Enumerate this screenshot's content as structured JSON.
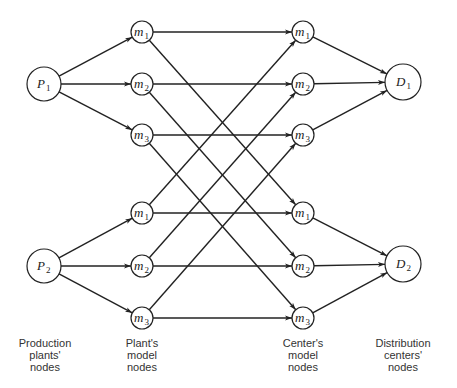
{
  "diagram": {
    "type": "network flow diagram",
    "nodes": {
      "production": [
        {
          "id": "P1",
          "label": "P",
          "sub": "1",
          "x": 44,
          "y": 84,
          "r": 17
        },
        {
          "id": "P2",
          "label": "P",
          "sub": "2",
          "x": 44,
          "y": 266,
          "r": 17
        }
      ],
      "plant_models": [
        {
          "id": "pm1a",
          "label": "m",
          "sub": "1",
          "x": 142,
          "y": 32,
          "r": 11
        },
        {
          "id": "pm2a",
          "label": "m",
          "sub": "2",
          "x": 142,
          "y": 84,
          "r": 11
        },
        {
          "id": "pm3a",
          "label": "m",
          "sub": "3",
          "x": 142,
          "y": 135,
          "r": 11
        },
        {
          "id": "pm1b",
          "label": "m",
          "sub": "1",
          "x": 142,
          "y": 213,
          "r": 11
        },
        {
          "id": "pm2b",
          "label": "m",
          "sub": "2",
          "x": 142,
          "y": 266,
          "r": 11
        },
        {
          "id": "pm3b",
          "label": "m",
          "sub": "3",
          "x": 142,
          "y": 318,
          "r": 11
        }
      ],
      "center_models": [
        {
          "id": "cm1a",
          "label": "m",
          "sub": "1",
          "x": 303,
          "y": 32,
          "r": 11
        },
        {
          "id": "cm2a",
          "label": "m",
          "sub": "2",
          "x": 303,
          "y": 84,
          "r": 11
        },
        {
          "id": "cm3a",
          "label": "m",
          "sub": "3",
          "x": 303,
          "y": 135,
          "r": 11
        },
        {
          "id": "cm1b",
          "label": "m",
          "sub": "1",
          "x": 303,
          "y": 213,
          "r": 11
        },
        {
          "id": "cm2b",
          "label": "m",
          "sub": "2",
          "x": 303,
          "y": 266,
          "r": 11
        },
        {
          "id": "cm3b",
          "label": "m",
          "sub": "3",
          "x": 303,
          "y": 318,
          "r": 11
        }
      ],
      "distribution": [
        {
          "id": "D1",
          "label": "D",
          "sub": "1",
          "x": 403,
          "y": 82,
          "r": 18
        },
        {
          "id": "D2",
          "label": "D",
          "sub": "2",
          "x": 403,
          "y": 264,
          "r": 18
        }
      ]
    },
    "edges": [
      [
        "P1",
        "pm1a"
      ],
      [
        "P1",
        "pm2a"
      ],
      [
        "P1",
        "pm3a"
      ],
      [
        "P2",
        "pm1b"
      ],
      [
        "P2",
        "pm2b"
      ],
      [
        "P2",
        "pm3b"
      ],
      [
        "pm1a",
        "cm1a"
      ],
      [
        "pm1a",
        "cm1b"
      ],
      [
        "pm2a",
        "cm2a"
      ],
      [
        "pm2a",
        "cm2b"
      ],
      [
        "pm3a",
        "cm3a"
      ],
      [
        "pm3a",
        "cm3b"
      ],
      [
        "pm1b",
        "cm1b"
      ],
      [
        "pm1b",
        "cm1a"
      ],
      [
        "pm2b",
        "cm2b"
      ],
      [
        "pm2b",
        "cm2a"
      ],
      [
        "pm3b",
        "cm3b"
      ],
      [
        "pm3b",
        "cm3a"
      ],
      [
        "cm1a",
        "D1"
      ],
      [
        "cm2a",
        "D1"
      ],
      [
        "cm3a",
        "D1"
      ],
      [
        "cm1b",
        "D2"
      ],
      [
        "cm2b",
        "D2"
      ],
      [
        "cm3b",
        "D2"
      ]
    ]
  },
  "captions": {
    "production": [
      "Production",
      "plants'",
      "nodes"
    ],
    "plant_models": [
      "Plant's",
      "model",
      "nodes"
    ],
    "center_models": [
      "Center's",
      "model",
      "nodes"
    ],
    "distribution": [
      "Distribution",
      "centers'",
      "nodes"
    ]
  }
}
